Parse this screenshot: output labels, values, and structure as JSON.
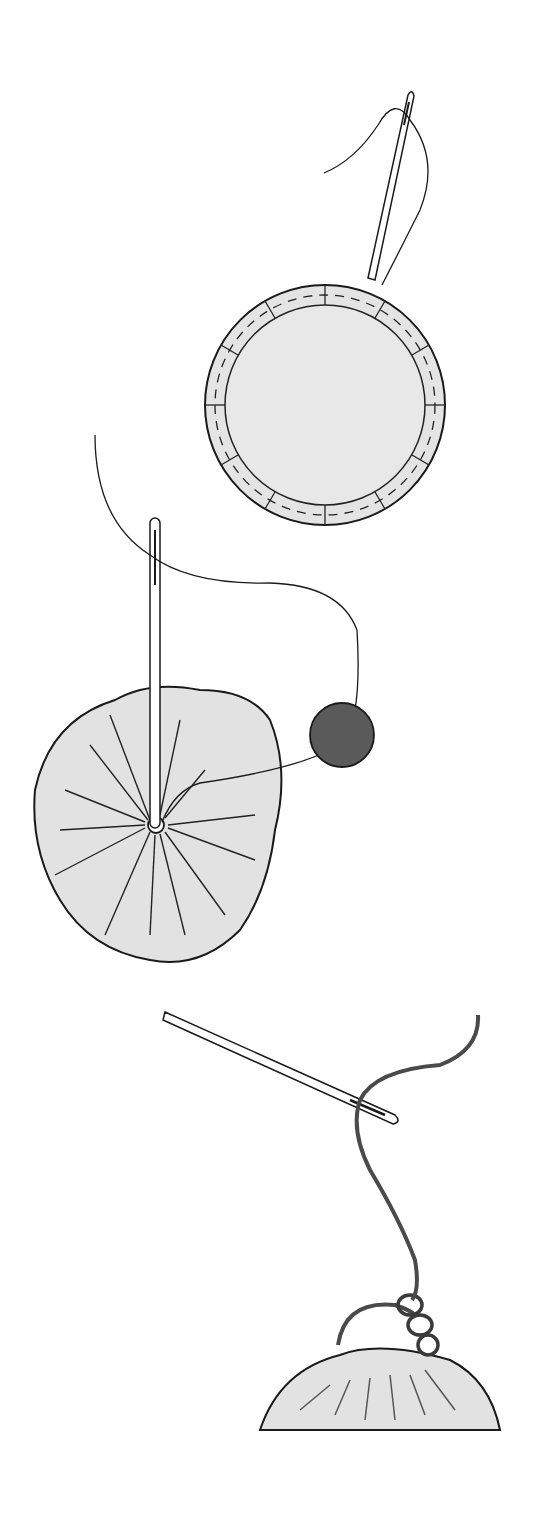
{
  "illustration": {
    "title": "Making a fabric yo-yo / gathered circle with bead",
    "steps": [
      {
        "id": "step-1",
        "description": "Running stitch around folded edge of fabric circle"
      },
      {
        "id": "step-2",
        "description": "Gather circle, needle through center, bead on thread"
      },
      {
        "id": "step-3",
        "description": "Secure gathered top with looped stitches"
      }
    ],
    "colors": {
      "background": "#ffffff",
      "fabric": "#e4e4e4",
      "outline": "#1a1a1a",
      "bead": "#5a5a5a",
      "thread_dark": "#4a4a4a"
    }
  }
}
